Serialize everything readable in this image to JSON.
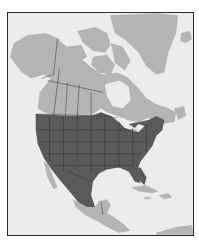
{
  "map": {
    "type": "range-map",
    "region": "North America",
    "colors": {
      "water": "#ececec",
      "land": "#b4b4b4",
      "range": "#5a5a5a",
      "borders": "#2e2e2e",
      "frame": "#2a2a2a"
    },
    "legend": [],
    "shaded_region_description": "Contiguous United States, southern Canada fringe and most of Mexico shaded dark; Canada, Alaska, Greenland, Central America and Caribbean shown in light gray"
  }
}
